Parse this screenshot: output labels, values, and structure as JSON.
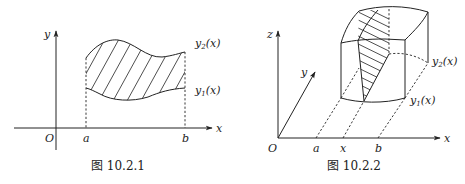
{
  "figures": [
    {
      "id": "fig1",
      "caption": "图 10.2.1",
      "axes": {
        "x_label": "x",
        "y_label": "y",
        "origin_label": "O"
      },
      "ticks": {
        "a": "a",
        "b": "b"
      },
      "curves": {
        "upper": "y",
        "upper_sub": "2",
        "upper_arg": "(x)",
        "lower": "y",
        "lower_sub": "1",
        "lower_arg": "(x)"
      },
      "region": "hatched area between y1(x) and y2(x) over [a, b]"
    },
    {
      "id": "fig2",
      "caption": "图 10.2.2",
      "axes": {
        "x_label": "x",
        "y_label": "y",
        "z_label": "z",
        "origin_label": "O"
      },
      "ticks": {
        "a": "a",
        "x": "x",
        "b": "b"
      },
      "curves": {
        "upper": "y",
        "upper_sub": "2",
        "upper_arg": "(x)",
        "lower": "y",
        "lower_sub": "1",
        "lower_arg": "(x)"
      },
      "region": "solid with hatched cross-section at x"
    }
  ]
}
